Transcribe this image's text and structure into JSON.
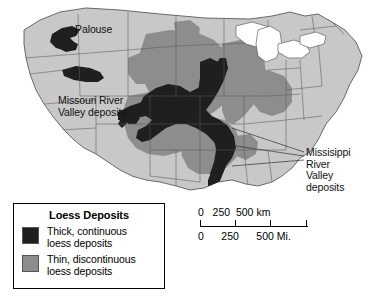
{
  "map": {
    "title_context": "Loess Deposits of the United States",
    "projection_note": "conterminous United States with state boundaries",
    "colors": {
      "thick_deposit": "#1f1f1f",
      "thin_deposit": "#8d8d8d",
      "land_base": "#c8c8c8",
      "state_border": "#5a5a5a",
      "coast_outline": "#4a4a4a",
      "water": "#ffffff",
      "text": "#111111"
    },
    "labels": [
      {
        "id": "palouse",
        "text": "Palouse"
      },
      {
        "id": "missouri",
        "text": "Missouri River\nValley deposits"
      },
      {
        "id": "mississippi",
        "text": "Missisippi\nRiver\nValley\ndeposits"
      }
    ]
  },
  "legend": {
    "title": "Loess Deposits",
    "items": [
      {
        "swatch_color": "#1f1f1f",
        "label": "Thick, continuous\nloess deposits"
      },
      {
        "swatch_color": "#8d8d8d",
        "label": "Thin, discontinuous\nloess deposits"
      }
    ]
  },
  "scalebar": {
    "km_labels": "0   250  500 km",
    "mi_labels": "0      250      500 Mi.",
    "km_values": [
      0,
      250,
      500
    ],
    "mi_values": [
      0,
      250,
      500
    ],
    "km_unit": "km",
    "mi_unit": "Mi."
  }
}
